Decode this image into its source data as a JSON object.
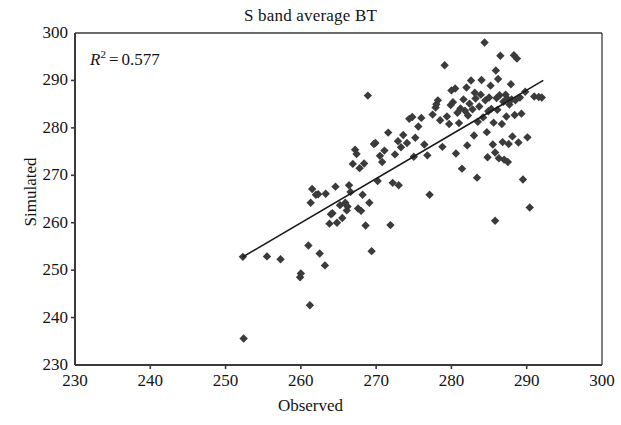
{
  "chart_data": {
    "type": "scatter",
    "title": "S band average BT",
    "xlabel": "Observed",
    "ylabel": "Simulated",
    "xlim": [
      230,
      300
    ],
    "ylim": [
      230,
      300
    ],
    "xticks": [
      230,
      240,
      250,
      260,
      270,
      280,
      290,
      300
    ],
    "yticks": [
      230,
      240,
      250,
      260,
      270,
      280,
      290,
      300
    ],
    "grid": false,
    "legend": null,
    "marker": {
      "shape": "diamond",
      "color": "#3b3b3b",
      "size": 6
    },
    "annotations": [
      {
        "symbol": "R",
        "exponent": "2",
        "operator": "=",
        "value": "0.577",
        "text": "R2 = 0.577"
      }
    ],
    "trendline": {
      "color": "#1a1a1a",
      "x_start": 252.3,
      "y_start": 252.8,
      "x_end": 292.2,
      "y_end": 290.0
    },
    "points": [
      [
        252.4,
        235.6
      ],
      [
        252.3,
        252.8
      ],
      [
        255.5,
        252.9
      ],
      [
        257.3,
        252.3
      ],
      [
        259.9,
        248.5
      ],
      [
        260.0,
        249.3
      ],
      [
        261.2,
        242.6
      ],
      [
        261.0,
        255.2
      ],
      [
        261.3,
        264.2
      ],
      [
        261.5,
        267.1
      ],
      [
        262.3,
        266.0
      ],
      [
        262.5,
        253.5
      ],
      [
        263.2,
        251.0
      ],
      [
        263.3,
        266.1
      ],
      [
        263.8,
        259.8
      ],
      [
        264.0,
        261.8
      ],
      [
        264.2,
        262.0
      ],
      [
        264.6,
        267.6
      ],
      [
        264.8,
        260.0
      ],
      [
        265.2,
        263.7
      ],
      [
        265.5,
        261.0
      ],
      [
        265.9,
        264.2
      ],
      [
        266.1,
        262.6
      ],
      [
        266.4,
        267.9
      ],
      [
        266.6,
        266.5
      ],
      [
        266.9,
        272.4
      ],
      [
        267.2,
        275.4
      ],
      [
        267.4,
        274.5
      ],
      [
        267.6,
        263.0
      ],
      [
        267.8,
        271.5
      ],
      [
        268.0,
        262.5
      ],
      [
        268.2,
        265.9
      ],
      [
        268.4,
        272.5
      ],
      [
        268.6,
        259.4
      ],
      [
        268.9,
        286.8
      ],
      [
        269.1,
        264.2
      ],
      [
        269.4,
        254.0
      ],
      [
        269.7,
        276.6
      ],
      [
        270.2,
        268.8
      ],
      [
        270.5,
        274.1
      ],
      [
        271.1,
        275.2
      ],
      [
        271.6,
        279.0
      ],
      [
        271.9,
        259.5
      ],
      [
        272.2,
        268.4
      ],
      [
        272.5,
        274.4
      ],
      [
        272.9,
        277.2
      ],
      [
        273.3,
        275.9
      ],
      [
        273.6,
        278.5
      ],
      [
        274.1,
        276.8
      ],
      [
        274.4,
        281.9
      ],
      [
        274.8,
        282.3
      ],
      [
        275.2,
        277.9
      ],
      [
        275.6,
        280.3
      ],
      [
        276.0,
        282.1
      ],
      [
        276.4,
        276.5
      ],
      [
        276.8,
        274.2
      ],
      [
        277.1,
        265.9
      ],
      [
        277.5,
        282.8
      ],
      [
        277.9,
        284.3
      ],
      [
        278.2,
        285.8
      ],
      [
        278.5,
        281.6
      ],
      [
        278.8,
        276.0
      ],
      [
        279.1,
        293.2
      ],
      [
        279.4,
        282.4
      ],
      [
        279.7,
        280.8
      ],
      [
        280.0,
        287.9
      ],
      [
        280.2,
        285.4
      ],
      [
        280.5,
        288.3
      ],
      [
        280.8,
        283.2
      ],
      [
        281.0,
        281.0
      ],
      [
        281.2,
        284.1
      ],
      [
        281.4,
        271.4
      ],
      [
        281.6,
        286.0
      ],
      [
        281.8,
        283.6
      ],
      [
        282.0,
        288.5
      ],
      [
        282.2,
        282.6
      ],
      [
        282.4,
        285.1
      ],
      [
        282.6,
        290.0
      ],
      [
        282.8,
        283.9
      ],
      [
        283.0,
        278.4
      ],
      [
        283.2,
        286.2
      ],
      [
        283.4,
        269.5
      ],
      [
        283.5,
        281.3
      ],
      [
        283.7,
        284.5
      ],
      [
        283.9,
        287.0
      ],
      [
        284.0,
        290.1
      ],
      [
        284.2,
        282.2
      ],
      [
        284.4,
        298.0
      ],
      [
        284.5,
        285.8
      ],
      [
        284.7,
        279.1
      ],
      [
        284.9,
        283.5
      ],
      [
        285.0,
        286.4
      ],
      [
        285.2,
        288.9
      ],
      [
        285.3,
        284.0
      ],
      [
        285.5,
        276.5
      ],
      [
        285.6,
        281.1
      ],
      [
        285.8,
        274.8
      ],
      [
        285.9,
        292.1
      ],
      [
        286.0,
        286.3
      ],
      [
        286.1,
        283.8
      ],
      [
        286.3,
        273.6
      ],
      [
        286.4,
        286.9
      ],
      [
        286.5,
        295.2
      ],
      [
        286.7,
        280.8
      ],
      [
        286.8,
        277.0
      ],
      [
        286.9,
        285.5
      ],
      [
        287.0,
        273.3
      ],
      [
        287.2,
        287.0
      ],
      [
        287.3,
        282.4
      ],
      [
        287.4,
        286.2
      ],
      [
        287.6,
        276.6
      ],
      [
        287.7,
        284.9
      ],
      [
        287.9,
        289.2
      ],
      [
        288.0,
        286.0
      ],
      [
        288.1,
        278.2
      ],
      [
        288.3,
        295.3
      ],
      [
        288.4,
        282.7
      ],
      [
        288.5,
        285.8
      ],
      [
        288.7,
        294.6
      ],
      [
        288.9,
        276.9
      ],
      [
        289.1,
        286.4
      ],
      [
        289.3,
        283.0
      ],
      [
        289.5,
        269.1
      ],
      [
        289.8,
        287.6
      ],
      [
        290.1,
        278.0
      ],
      [
        290.4,
        263.2
      ],
      [
        291.0,
        286.6
      ],
      [
        291.6,
        286.5
      ],
      [
        292.0,
        286.4
      ],
      [
        285.8,
        260.4
      ],
      [
        262.0,
        265.9
      ],
      [
        266.2,
        263.4
      ],
      [
        270.8,
        272.8
      ],
      [
        279.9,
        284.8
      ],
      [
        283.1,
        287.4
      ],
      [
        286.2,
        290.3
      ],
      [
        280.6,
        274.6
      ],
      [
        284.8,
        273.8
      ],
      [
        282.1,
        276.3
      ],
      [
        287.5,
        272.8
      ],
      [
        278.0,
        285.0
      ],
      [
        275.0,
        273.9
      ],
      [
        273.0,
        267.9
      ],
      [
        269.9,
        276.8
      ]
    ]
  }
}
